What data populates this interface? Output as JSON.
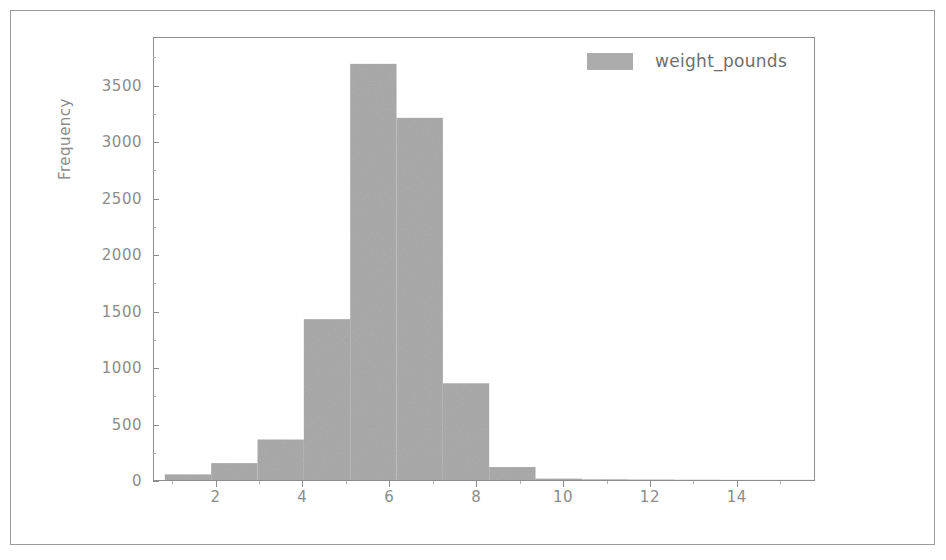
{
  "chart_data": {
    "type": "bar",
    "title": "",
    "xlabel": "",
    "ylabel": "Frequency",
    "xlim": [
      0.56,
      15.8
    ],
    "ylim": [
      0,
      3930
    ],
    "grid": false,
    "legend_position": "upper right",
    "bar_color": "#acacac",
    "axis_color": "#8d8d8d",
    "tick_label_color": "#8c8c8c",
    "series": [
      {
        "name": "weight_pounds",
        "bin_edges": [
          0.81,
          1.88,
          2.95,
          4.02,
          5.09,
          6.16,
          7.23,
          8.3,
          9.37,
          10.44,
          11.51,
          12.58,
          13.65,
          14.72,
          15.79
        ],
        "values": [
          50,
          150,
          360,
          1430,
          3700,
          3220,
          860,
          115,
          12,
          6,
          4,
          2,
          1,
          1
        ]
      }
    ],
    "xticks": [
      2,
      4,
      6,
      8,
      10,
      12,
      14
    ],
    "xtick_labels": [
      "2",
      "4",
      "6",
      "8",
      "10",
      "12",
      "14"
    ],
    "xminor_ticks": [
      1,
      3,
      5,
      7,
      9,
      11,
      13,
      15
    ],
    "yticks": [
      0,
      500,
      1000,
      1500,
      2000,
      2500,
      3000,
      3500
    ],
    "ytick_labels": [
      "0",
      "500",
      "1000",
      "1500",
      "2000",
      "2500",
      "3000",
      "3500"
    ],
    "yminor_ticks": [
      250,
      750,
      1250,
      1750,
      2250,
      2750,
      3250,
      3750
    ]
  },
  "legend": {
    "label": "weight_pounds",
    "swatch_color": "#acacac"
  }
}
